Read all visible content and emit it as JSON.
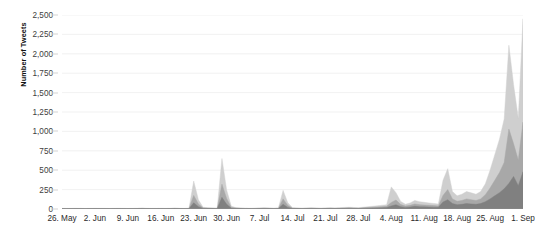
{
  "chart_data": {
    "type": "area",
    "title": "",
    "subtitle": "",
    "xlabel": "",
    "ylabel": "Number of Tweets",
    "ylim": [
      0,
      2500
    ],
    "ytick_values": [
      0,
      250,
      500,
      750,
      1000,
      1250,
      1500,
      1750,
      2000,
      2250,
      2500
    ],
    "ytick_labels": [
      "0",
      "250",
      "500",
      "750",
      "1,000",
      "1,250",
      "1,500",
      "1,750",
      "2,000",
      "2,250",
      "2,500"
    ],
    "xtick_labels": [
      "26. May",
      "2. Jun",
      "9. Jun",
      "16. Jun",
      "23. Jun",
      "30. Jun",
      "7. Jul",
      "14. Jul",
      "21. Jul",
      "28. Jul",
      "4. Aug",
      "11. Aug",
      "18. Aug",
      "25. Aug",
      "1. Sep"
    ],
    "xtick_indices": [
      0,
      7,
      14,
      21,
      28,
      35,
      42,
      49,
      56,
      63,
      70,
      77,
      84,
      91,
      98
    ],
    "grid": true,
    "grid_color": "#ededed",
    "legend": "none",
    "stacked": true,
    "x_start_label": "26. May",
    "x_end_label": "1. Sep",
    "n_points": 99,
    "series": [
      {
        "name": "series-dark",
        "color": "#808080",
        "values": [
          3,
          2,
          3,
          4,
          3,
          2,
          3,
          4,
          3,
          3,
          2,
          3,
          4,
          3,
          2,
          3,
          4,
          5,
          4,
          3,
          3,
          4,
          3,
          4,
          5,
          4,
          3,
          4,
          80,
          30,
          8,
          6,
          5,
          4,
          150,
          60,
          10,
          6,
          5,
          4,
          3,
          4,
          5,
          6,
          5,
          4,
          5,
          60,
          20,
          6,
          5,
          4,
          5,
          6,
          5,
          4,
          5,
          6,
          5,
          6,
          7,
          8,
          7,
          6,
          8,
          10,
          12,
          14,
          16,
          18,
          40,
          55,
          30,
          20,
          25,
          35,
          30,
          28,
          26,
          24,
          22,
          90,
          120,
          70,
          55,
          60,
          70,
          65,
          60,
          70,
          95,
          130,
          170,
          210,
          260,
          330,
          420,
          300,
          480
        ]
      },
      {
        "name": "series-mid",
        "color": "#a8a8a8",
        "values": [
          2,
          2,
          2,
          2,
          2,
          2,
          2,
          2,
          2,
          2,
          2,
          2,
          2,
          2,
          2,
          2,
          2,
          3,
          2,
          2,
          2,
          2,
          2,
          2,
          3,
          2,
          2,
          3,
          95,
          35,
          6,
          5,
          4,
          3,
          170,
          75,
          10,
          5,
          4,
          3,
          3,
          3,
          4,
          5,
          4,
          3,
          4,
          70,
          25,
          5,
          4,
          3,
          4,
          5,
          4,
          3,
          4,
          5,
          4,
          5,
          6,
          7,
          6,
          5,
          7,
          9,
          10,
          12,
          14,
          16,
          45,
          60,
          28,
          18,
          22,
          30,
          26,
          24,
          22,
          20,
          18,
          85,
          130,
          60,
          45,
          50,
          60,
          55,
          50,
          60,
          90,
          140,
          200,
          260,
          340,
          700,
          420,
          330,
          640
        ]
      },
      {
        "name": "series-light",
        "color": "#cfcfcf",
        "values": [
          3,
          3,
          3,
          3,
          3,
          3,
          3,
          3,
          3,
          3,
          3,
          3,
          3,
          3,
          3,
          3,
          3,
          4,
          3,
          3,
          3,
          3,
          3,
          3,
          4,
          3,
          3,
          4,
          185,
          55,
          8,
          6,
          5,
          4,
          330,
          110,
          14,
          7,
          5,
          4,
          4,
          4,
          5,
          6,
          5,
          4,
          5,
          110,
          35,
          6,
          5,
          4,
          5,
          6,
          5,
          4,
          5,
          6,
          5,
          6,
          7,
          8,
          7,
          6,
          8,
          11,
          13,
          15,
          18,
          21,
          200,
          95,
          40,
          24,
          30,
          45,
          38,
          34,
          30,
          28,
          24,
          195,
          270,
          95,
          70,
          80,
          95,
          88,
          80,
          95,
          140,
          230,
          330,
          430,
          560,
          1080,
          760,
          540,
          1330
        ]
      }
    ],
    "peaks": [
      {
        "label": "23. Jun",
        "value": 380
      },
      {
        "label": "30. Jun",
        "value": 650
      },
      {
        "label": "7. Jul",
        "value": 240
      },
      {
        "label": "4. Aug",
        "value": 285
      },
      {
        "label": "18. Aug",
        "value": 520
      },
      {
        "label": "30. Aug",
        "value": 2100
      },
      {
        "label": "1. Sep",
        "value": 2450
      }
    ]
  },
  "axis": {
    "y_title": "Number of Tweets"
  }
}
